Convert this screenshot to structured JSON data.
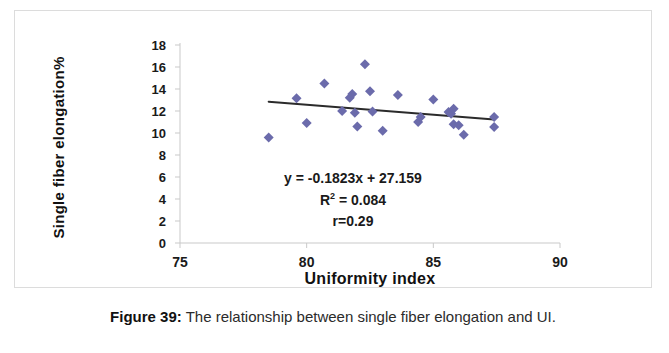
{
  "figure": {
    "caption_label": "Figure 39:",
    "caption_text": " The relationship between single fiber elongation and UI."
  },
  "chart_data": {
    "type": "scatter",
    "title": "",
    "xlabel": "Uniformity index",
    "ylabel": "Single fiber elongation%",
    "xlim": [
      75,
      90
    ],
    "ylim": [
      0,
      18
    ],
    "xticks": [
      75,
      80,
      85,
      90
    ],
    "yticks": [
      0,
      2,
      4,
      6,
      8,
      10,
      12,
      14,
      16,
      18
    ],
    "grid": false,
    "legend": "none",
    "marker": "diamond",
    "marker_color": "#6b6bab",
    "marker_size": 5,
    "points": [
      {
        "x": 78.5,
        "y": 9.6
      },
      {
        "x": 79.6,
        "y": 13.15
      },
      {
        "x": 80.0,
        "y": 10.9
      },
      {
        "x": 80.7,
        "y": 14.5
      },
      {
        "x": 81.4,
        "y": 12.0
      },
      {
        "x": 81.7,
        "y": 13.2
      },
      {
        "x": 81.8,
        "y": 13.55
      },
      {
        "x": 81.9,
        "y": 11.85
      },
      {
        "x": 82.0,
        "y": 10.6
      },
      {
        "x": 82.3,
        "y": 16.25
      },
      {
        "x": 82.5,
        "y": 13.8
      },
      {
        "x": 82.6,
        "y": 11.95
      },
      {
        "x": 83.0,
        "y": 10.2
      },
      {
        "x": 83.6,
        "y": 13.45
      },
      {
        "x": 84.4,
        "y": 11.0
      },
      {
        "x": 84.5,
        "y": 11.45
      },
      {
        "x": 85.0,
        "y": 13.05
      },
      {
        "x": 85.6,
        "y": 11.9
      },
      {
        "x": 85.7,
        "y": 11.75
      },
      {
        "x": 85.8,
        "y": 12.2
      },
      {
        "x": 85.8,
        "y": 10.8
      },
      {
        "x": 86.0,
        "y": 10.7
      },
      {
        "x": 86.2,
        "y": 9.85
      },
      {
        "x": 87.4,
        "y": 11.45
      },
      {
        "x": 87.4,
        "y": 10.55
      }
    ],
    "trendline": {
      "slope": -0.1823,
      "intercept": 27.159,
      "x_start": 78.5,
      "x_end": 87.4,
      "color": "#2b2b2b",
      "width": 2
    },
    "annotations": {
      "equation_prefix": "y = -0.1823x + 27.159",
      "r_squared_prefix": "R",
      "r_squared_sup": "2",
      "r_squared_suffix": " = 0.084",
      "r_value": "r=0.29"
    },
    "axis_color": "#c9c9c9",
    "tick_label_color": "#1a1a1a"
  }
}
